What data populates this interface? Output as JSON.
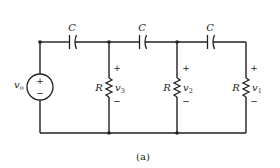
{
  "figure": {
    "caption": "(a)"
  },
  "source": {
    "label": "v",
    "subscript": "o",
    "plus": "+",
    "minus": "−"
  },
  "capacitors": [
    {
      "label": "C"
    },
    {
      "label": "C"
    },
    {
      "label": "C"
    }
  ],
  "resistors": [
    {
      "label": "R",
      "voltage": "v",
      "voltage_sub": "3",
      "plus": "+",
      "minus": "−"
    },
    {
      "label": "R",
      "voltage": "v",
      "voltage_sub": "2",
      "plus": "+",
      "minus": "−"
    },
    {
      "label": "R",
      "voltage": "v",
      "voltage_sub": "1",
      "plus": "+",
      "minus": "−"
    }
  ],
  "colors": {
    "line": "#231f20",
    "background": "#ffffff"
  }
}
